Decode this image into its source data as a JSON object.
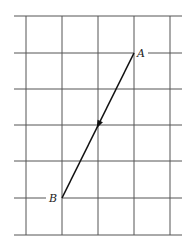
{
  "diagram": {
    "type": "vector-on-grid",
    "grid": {
      "columns_x": [
        26,
        62,
        98,
        134,
        170
      ],
      "rows_y": [
        16,
        53,
        89,
        125,
        161,
        198,
        235
      ],
      "x_start": 14,
      "x_end": 182,
      "line_color": "#555555"
    },
    "points": {
      "A": {
        "label": "A",
        "x": 134,
        "y": 53
      },
      "B": {
        "label": "B",
        "x": 62,
        "y": 198
      }
    },
    "vector": {
      "from": "A",
      "to": "B",
      "arrowhead_at_midpoint": true,
      "color": "#111111"
    }
  }
}
